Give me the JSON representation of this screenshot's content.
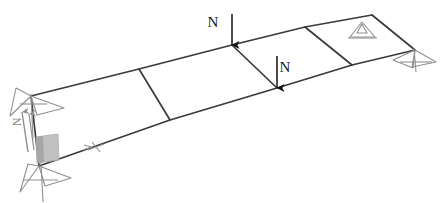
{
  "diagram": {
    "type": "structural-frame-3d",
    "background_color": "#ffffff",
    "member_color": "#3a3a3a",
    "support_color": "#8f8f8f",
    "load_color": "#111111",
    "shaded_color": "#b4b4b4",
    "loads": [
      {
        "id": "load-top",
        "label": "N",
        "label_x": 213,
        "label_y": 27,
        "arrow_x": 232,
        "arrow_y_start": 14,
        "arrow_y_end": 45,
        "direction": "down"
      },
      {
        "id": "load-bottom",
        "label": "N",
        "label_x": 281,
        "label_y": 72,
        "arrow_x": 277,
        "arrow_y_start": 56,
        "arrow_y_end": 88,
        "direction": "down"
      }
    ],
    "reactions": [
      {
        "id": "reaction-left-vertical",
        "label": "N",
        "label_x": 21,
        "label_y": 122,
        "direction": "up",
        "rotated": true
      }
    ],
    "supports": [
      {
        "id": "support-left-top",
        "x": 31,
        "y": 96,
        "kind": "pin-double-triangle"
      },
      {
        "id": "support-left-bottom",
        "x": 39,
        "y": 166,
        "kind": "pin-double-triangle"
      },
      {
        "id": "support-right-top",
        "x": 362,
        "y": 22,
        "kind": "pin-triangle"
      },
      {
        "id": "support-right-bottom",
        "x": 415,
        "y": 50,
        "kind": "pin-double-triangle"
      }
    ],
    "nodes": {
      "top_edge": [
        {
          "x": 31,
          "y": 96
        },
        {
          "x": 139,
          "y": 69
        },
        {
          "x": 232,
          "y": 45
        },
        {
          "x": 305,
          "y": 27
        },
        {
          "x": 362,
          "y": 22
        },
        {
          "x": 372,
          "y": 15
        }
      ],
      "bottom_edge": [
        {
          "x": 39,
          "y": 166
        },
        {
          "x": 170,
          "y": 120
        },
        {
          "x": 277,
          "y": 88
        },
        {
          "x": 352,
          "y": 65
        },
        {
          "x": 415,
          "y": 50
        }
      ]
    },
    "bay_count": 4,
    "shaded_patch": {
      "x": 36,
      "y": 136,
      "width": 22,
      "height": 26
    },
    "edge_marker": {
      "id": "bottom-edge-tick",
      "x": 96,
      "y": 146
    }
  }
}
